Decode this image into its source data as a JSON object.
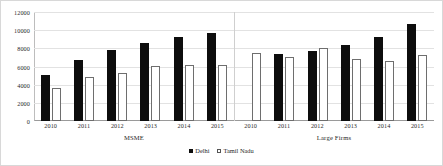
{
  "chart_data": {
    "type": "bar",
    "title": "",
    "xlabel": "",
    "ylabel": "",
    "ylim": [
      0,
      12000
    ],
    "yticks": [
      0,
      2000,
      4000,
      6000,
      8000,
      10000,
      12000
    ],
    "ytick_labels": [
      "0",
      "2000",
      "4000",
      "6000",
      "8000",
      "10000",
      "12000"
    ],
    "grid": true,
    "legend_position": "bottom-center",
    "legend": [
      "Delhi",
      "Tamil Nadu"
    ],
    "groups": [
      {
        "label": "MSME",
        "categories": [
          "2010",
          "2011",
          "2012",
          "2013",
          "2014",
          "2015"
        ],
        "series": [
          {
            "name": "Delhi",
            "values": [
              5100,
              6700,
              7800,
              8600,
              9200,
              9700
            ]
          },
          {
            "name": "Tamil Nadu",
            "values": [
              3600,
              4900,
              5300,
              6100,
              6200,
              6200
            ]
          }
        ]
      },
      {
        "label": "Large Firms",
        "categories": [
          "2010",
          "2011",
          "2012",
          "2013",
          "2014",
          "2015"
        ],
        "series": [
          {
            "name": "Delhi",
            "values": [
              null,
              7400,
              7700,
              8400,
              9200,
              10700
            ]
          },
          {
            "name": "Tamil Nadu",
            "values": [
              7500,
              7000,
              8000,
              6800,
              6600,
              7300
            ]
          }
        ]
      }
    ],
    "colors": {
      "delhi": "#0d0d0d",
      "tamil_nadu_fill": "#ffffff",
      "tamil_nadu_border": "#6e6e6e",
      "gridline": "#e2e2e2",
      "axis": "#9a9a9a",
      "background": "#ffffff"
    }
  }
}
